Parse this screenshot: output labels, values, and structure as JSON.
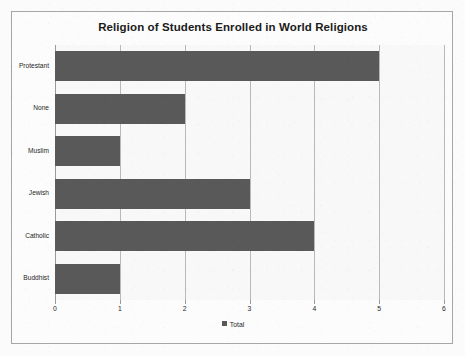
{
  "chart_data": {
    "type": "bar",
    "orientation": "horizontal",
    "title": "Religion of Students Enrolled in World Religions",
    "categories": [
      "Protestant",
      "None",
      "Muslim",
      "Jewish",
      "Catholic",
      "Buddhist"
    ],
    "values": [
      5,
      2,
      1,
      3,
      4,
      1
    ],
    "series": [
      {
        "name": "Total",
        "values": [
          5,
          2,
          1,
          3,
          4,
          1
        ]
      }
    ],
    "xlabel": "",
    "ylabel": "",
    "xlim": [
      0,
      6
    ],
    "xticks": [
      0,
      1,
      2,
      3,
      4,
      5,
      6
    ],
    "xtick_labels": [
      "0",
      "1",
      "2",
      "3",
      "4",
      "5",
      "6"
    ],
    "grid": true,
    "grid_axis": "x",
    "legend": {
      "position": "bottom",
      "entries": [
        "Total"
      ]
    },
    "colors": {
      "bar": "#595959",
      "gridline": "#b9b9b9",
      "frame_border": "#a6a6a6",
      "plot_background": "#f8f8f8",
      "figure_background": "#fbfbfb",
      "text": "#262626",
      "title_text": "#1a1a1a"
    }
  },
  "legend": {
    "swatch_icon": "legend-square-icon",
    "label": "Total"
  }
}
